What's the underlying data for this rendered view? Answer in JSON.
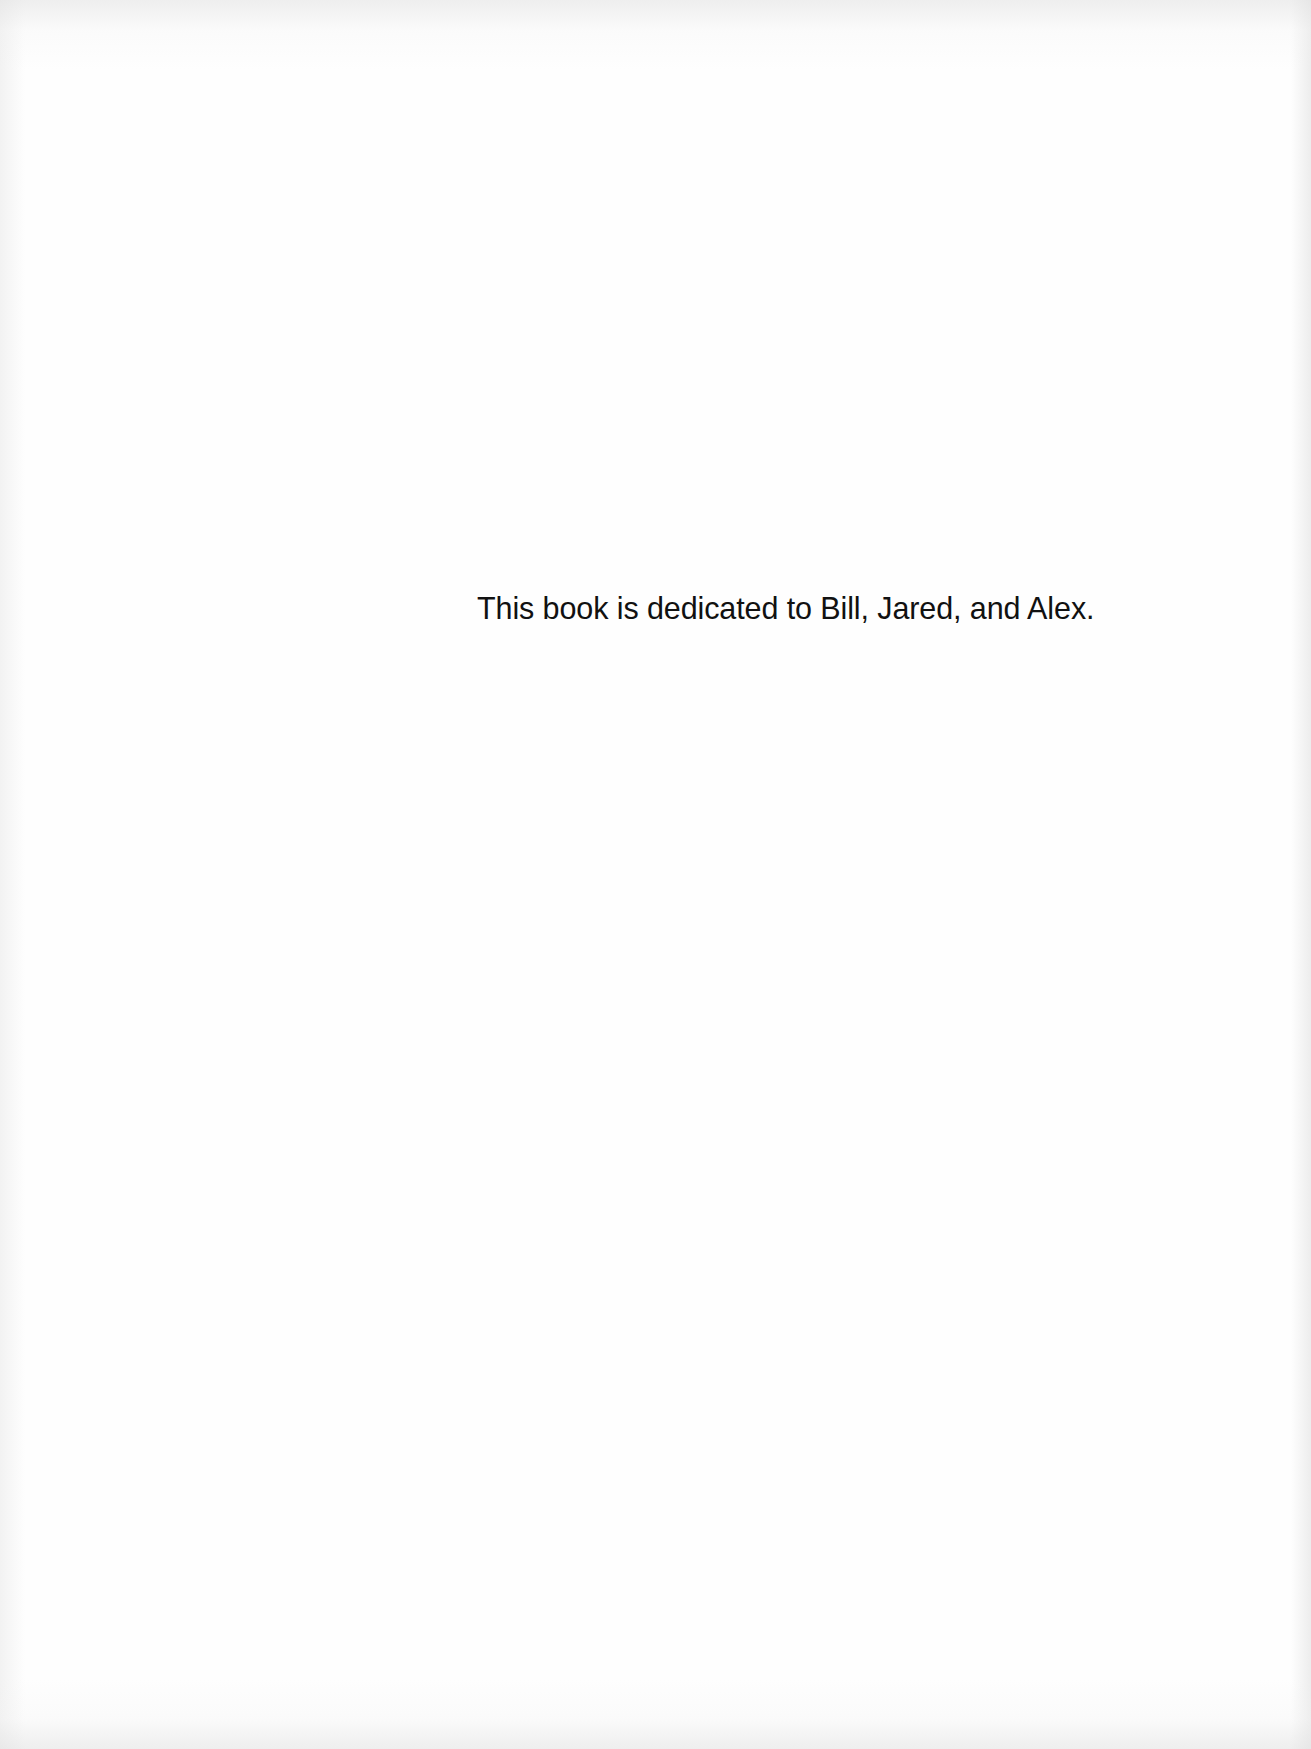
{
  "document": {
    "type": "dedication-page",
    "dedication_text": "This book is dedicated to Bill, Jared, and Alex."
  },
  "colors": {
    "paper": "#fefefe",
    "text": "#111111"
  }
}
